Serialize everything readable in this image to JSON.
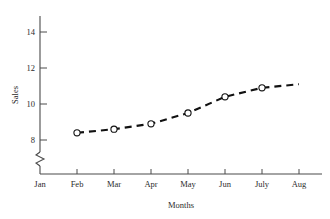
{
  "chart_data": {
    "type": "line",
    "title": "",
    "xlabel": "Months",
    "ylabel": "Sales",
    "categories": [
      "Jan",
      "Feb",
      "Mar",
      "Apr",
      "May",
      "Jun",
      "July",
      "Aug"
    ],
    "values": [
      null,
      8.4,
      8.6,
      8.9,
      9.5,
      10.4,
      10.9,
      11.1
    ],
    "series": [
      {
        "name": "Sales",
        "values": [
          null,
          8.4,
          8.6,
          8.9,
          9.5,
          10.4,
          10.9,
          11.1
        ],
        "marker": "open-circle",
        "linestyle": "dashed",
        "color": "#111111"
      }
    ],
    "markers_shown_at": [
      "Feb",
      "Mar",
      "Apr",
      "May",
      "Jun",
      "July"
    ],
    "xlim": [
      "Jan",
      "Aug"
    ],
    "ylim": [
      7.4,
      15.0
    ],
    "yticks": [
      8,
      10,
      12,
      14
    ],
    "ytick_labels": [
      "8",
      "10",
      "12",
      "14"
    ],
    "xticks": [
      "Jan",
      "Feb",
      "Mar",
      "Apr",
      "May",
      "Jun",
      "July",
      "Aug"
    ],
    "grid": false,
    "legend": false,
    "axis_break": {
      "axis": "y",
      "symbol": "zigzag",
      "below_value": 8,
      "note": ""
    }
  },
  "axes": {
    "y_label": "Sales",
    "x_label": "Months",
    "y_tick_labels": [
      "14",
      "12",
      "10",
      "8"
    ],
    "x_tick_labels": [
      "Jan",
      "Feb",
      "Mar",
      "Apr",
      "May",
      "Jun",
      "July",
      "Aug"
    ]
  },
  "colors": {
    "axis": "#4a4a4a",
    "series": "#111111",
    "marker_fill": "#ffffff",
    "background": "#ffffff",
    "text": "#2b2b2b"
  }
}
